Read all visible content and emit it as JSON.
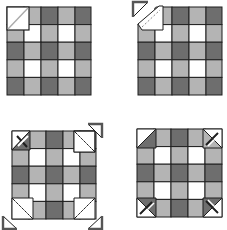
{
  "diagram": {
    "title": "",
    "colors": {
      "dark": "#6e6e6e",
      "light": "#b4b4b4",
      "white": "#ffffff",
      "outline": "#1e1e1e",
      "corner_dark": "#555555"
    },
    "grid": [
      [
        "W",
        "L",
        "D",
        "L",
        "D"
      ],
      [
        "L",
        "W",
        "L",
        "W",
        "L"
      ],
      [
        "D",
        "L",
        "D",
        "L",
        "D"
      ],
      [
        "L",
        "W",
        "L",
        "W",
        "L"
      ],
      [
        "D",
        "L",
        "D",
        "L",
        "D"
      ]
    ],
    "panels": [
      {
        "step": 1,
        "label": "Square with diagonal marked on top-left corner"
      },
      {
        "step": 2,
        "label": "Top-left corner sewn and folded back"
      },
      {
        "step": 3,
        "label": "Corner squares placed on all four corners"
      },
      {
        "step": 4,
        "label": "Finished block with four snowball corners"
      }
    ]
  }
}
